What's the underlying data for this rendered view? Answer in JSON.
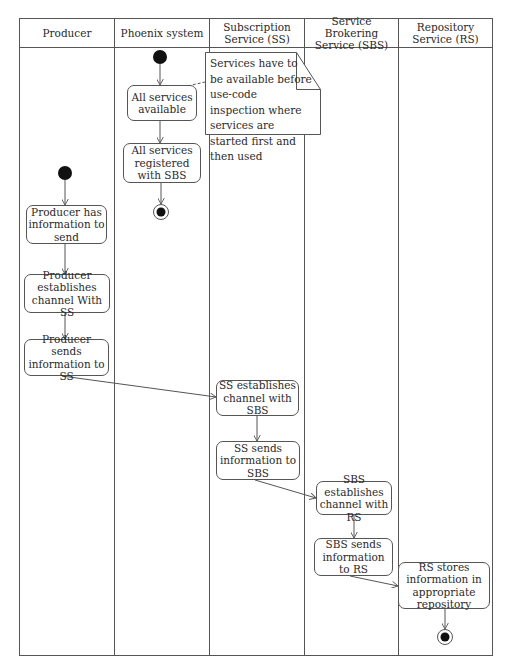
{
  "swimlanes": [
    {
      "id": "producer",
      "label": "Producer"
    },
    {
      "id": "phoenix",
      "label": "Phoenix system"
    },
    {
      "id": "ss",
      "label": "Subscription Service (SS)"
    },
    {
      "id": "sbs",
      "label": "Service Brokering Service (SBS)"
    },
    {
      "id": "rs",
      "label": "Repository Service (RS)"
    }
  ],
  "nodes": {
    "all_services_available": "All services available",
    "all_services_registered": "All services registered with SBS",
    "producer_has_info": "Producer has information to send",
    "producer_establishes": "Producer establishes channel With SS",
    "producer_sends": "Producer sends information to SS",
    "ss_establishes": "SS establishes channel with SBS",
    "ss_sends": "SS sends information to SBS",
    "sbs_establishes": "SBS establishes channel with RS",
    "sbs_sends": "SBS sends information to RS",
    "rs_stores": "RS stores information in appropriate repository"
  },
  "note": {
    "text": "Services have to be available before use-code inspection where services are started first and then used"
  },
  "colors": {
    "line": "#555555",
    "fill_dot": "#111111"
  }
}
